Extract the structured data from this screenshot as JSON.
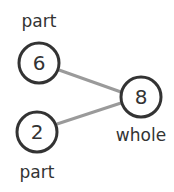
{
  "diagram": {
    "type": "number-bond",
    "colors": {
      "stroke": "#333333",
      "connector": "#9a9a9a",
      "text": "#333333"
    },
    "nodes": [
      {
        "id": "top",
        "role": "part",
        "value": "6",
        "label": "part",
        "cx": 39,
        "cy": 63
      },
      {
        "id": "bottom",
        "role": "part",
        "value": "2",
        "label": "part",
        "cx": 37,
        "cy": 132
      },
      {
        "id": "whole",
        "role": "whole",
        "value": "8",
        "label": "whole",
        "cx": 141,
        "cy": 97
      }
    ]
  }
}
